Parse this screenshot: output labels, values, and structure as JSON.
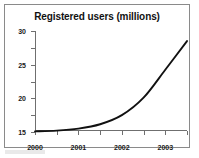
{
  "figure": {
    "frame_color": "#8a8a8a",
    "background": "#ffffff"
  },
  "chart_data": {
    "type": "line",
    "title": "Registered users (millions)",
    "xlabel": "",
    "ylabel": "",
    "x": [
      2000,
      2001,
      2002,
      2003,
      2004,
      2005,
      2006,
      2007
    ],
    "categories": [
      "2000",
      "2001",
      "2002",
      "2003",
      "2004",
      "2005",
      "2006",
      "2007"
    ],
    "values": [
      0.2,
      0.4,
      1.0,
      2.3,
      5.0,
      10.2,
      18.5,
      27.0
    ],
    "series": [
      {
        "name": "Registered users",
        "values": [
          0.2,
          0.4,
          1.0,
          2.3,
          5.0,
          10.2,
          18.5,
          27.0
        ],
        "color": "#111111"
      }
    ],
    "xlim": [
      2000,
      2007
    ],
    "ylim": [
      0,
      30
    ],
    "yticks": [
      0,
      5,
      10,
      15,
      20,
      25,
      30
    ],
    "ytick_labels": [
      "0",
      "5",
      "10",
      "15",
      "20",
      "25",
      "30"
    ],
    "xtick_labels": [
      "2000",
      "2001",
      "2002",
      "2003",
      "2004",
      "2005",
      "2006",
      "2007"
    ],
    "grid": false,
    "legend": false,
    "legend_position": "none",
    "line_color": "#111111",
    "axis_color": "#6f6f6f"
  }
}
